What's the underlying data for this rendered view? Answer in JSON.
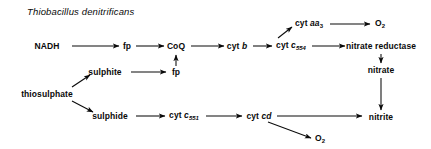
{
  "figure": {
    "title": "Thiobacillus denitrificans",
    "organism": "Thiobacillus denitrificans",
    "width": 431,
    "height": 149,
    "ink_color": "#0a0a0a",
    "background": "#ffffff"
  },
  "nodes": {
    "nadh": {
      "label": "NADH",
      "x": 47,
      "y": 46
    },
    "fp_main": {
      "label": "fp",
      "x": 127,
      "y": 46
    },
    "coq": {
      "label": "CoQ",
      "x": 176,
      "y": 46
    },
    "cyt_b": {
      "label": "cyt b",
      "x": 237,
      "y": 46
    },
    "cyt_c554": {
      "label": "cyt c554",
      "x": 291,
      "y": 46
    },
    "cyt_aa3": {
      "label": "cyt aa3",
      "x": 309,
      "y": 24
    },
    "o2_top": {
      "label": "O2",
      "x": 380,
      "y": 24
    },
    "nitrate_reductase": {
      "label": "nitrate reductase",
      "x": 381,
      "y": 46
    },
    "nitrate": {
      "label": "nitrate",
      "x": 381,
      "y": 70
    },
    "nitrite": {
      "label": "nitrite",
      "x": 381,
      "y": 117
    },
    "sulphite": {
      "label": "sulphite",
      "x": 105,
      "y": 72
    },
    "fp_sulphite": {
      "label": "fp",
      "x": 176,
      "y": 72
    },
    "thiosulphate": {
      "label": "thiosulphate",
      "x": 47,
      "y": 94
    },
    "sulphide": {
      "label": "sulphide",
      "x": 110,
      "y": 116
    },
    "cyt_c551": {
      "label": "cyt c551",
      "x": 184,
      "y": 116
    },
    "cyt_cd": {
      "label": "cyt cd",
      "x": 259,
      "y": 116
    },
    "o2_bottom": {
      "label": "O2",
      "x": 320,
      "y": 139
    }
  },
  "edges": [
    {
      "from": "NADH",
      "to": "fp",
      "kind": "horizontal"
    },
    {
      "from": "fp",
      "to": "CoQ",
      "kind": "horizontal"
    },
    {
      "from": "CoQ",
      "to": "cyt b",
      "kind": "horizontal"
    },
    {
      "from": "cyt b",
      "to": "cyt c554",
      "kind": "horizontal"
    },
    {
      "from": "cyt c554",
      "to": "cyt aa3",
      "kind": "diagonal-up"
    },
    {
      "from": "cyt aa3",
      "to": "O2",
      "kind": "horizontal"
    },
    {
      "from": "cyt c554",
      "to": "nitrate reductase",
      "kind": "horizontal"
    },
    {
      "from": "nitrate reductase",
      "to": "nitrate",
      "kind": "vertical-down"
    },
    {
      "from": "nitrate",
      "to": "nitrite",
      "kind": "vertical-down"
    },
    {
      "from": "sulphite",
      "to": "fp",
      "kind": "horizontal"
    },
    {
      "from": "fp",
      "to": "CoQ",
      "kind": "vertical-up"
    },
    {
      "from": "thiosulphate",
      "to": "sulphite",
      "kind": "diagonal-up"
    },
    {
      "from": "thiosulphate",
      "to": "sulphide",
      "kind": "diagonal-down"
    },
    {
      "from": "sulphide",
      "to": "cyt c551",
      "kind": "horizontal"
    },
    {
      "from": "cyt c551",
      "to": "cyt cd",
      "kind": "horizontal"
    },
    {
      "from": "cyt cd",
      "to": "nitrite",
      "kind": "horizontal"
    },
    {
      "from": "cyt cd",
      "to": "O2",
      "kind": "diagonal-down"
    }
  ]
}
